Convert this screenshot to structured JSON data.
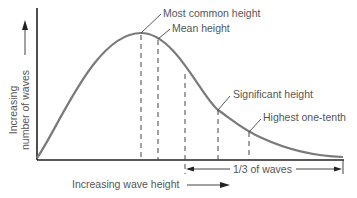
{
  "diagram": {
    "y_axis_label_line1": "Increasing",
    "y_axis_label_line2": "number of waves",
    "x_axis_label": "Increasing wave height",
    "annotations": {
      "most_common": "Most common height",
      "mean": "Mean height",
      "significant": "Significant height",
      "highest_tenth": "Highest one-tenth",
      "third": "1/3 of waves"
    },
    "colors": {
      "curve": "#7a7a7a",
      "axis": "#222222",
      "text": "#555555"
    }
  }
}
